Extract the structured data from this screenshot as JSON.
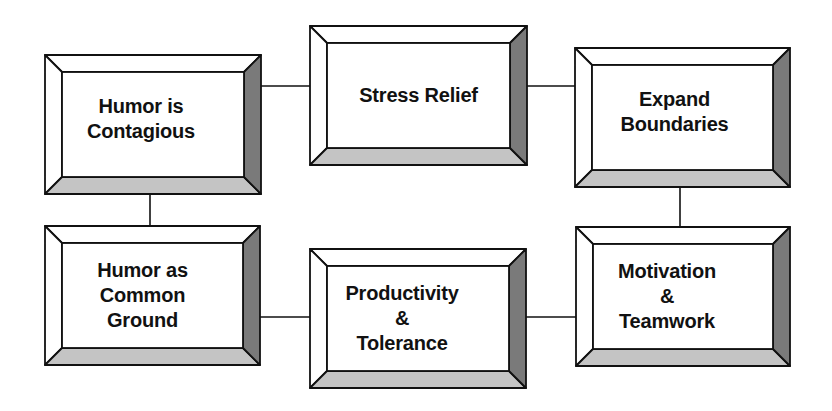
{
  "diagram": {
    "type": "bevel-box-flow",
    "colors": {
      "background": "#ffffff",
      "face": "#ffffff",
      "outline": "#111111",
      "bevel_top": "#ffffff",
      "bevel_left": "#ffffff",
      "bevel_bottom": "#c4c4c4",
      "bevel_right": "#7a7a7a",
      "connector": "#111111"
    },
    "boxes": [
      {
        "id": "humor-is-contagious",
        "lines": [
          "Humor is",
          "Contagious"
        ]
      },
      {
        "id": "stress-relief",
        "lines": [
          "Stress Relief"
        ]
      },
      {
        "id": "expand-boundaries",
        "lines": [
          "Expand",
          "Boundaries"
        ]
      },
      {
        "id": "humor-as-common-ground",
        "lines": [
          "Humor as",
          "Common",
          "Ground"
        ]
      },
      {
        "id": "productivity-tolerance",
        "lines": [
          "Productivity",
          "&",
          "Tolerance"
        ]
      },
      {
        "id": "motivation-teamwork",
        "lines": [
          "Motivation",
          "&",
          "Teamwork"
        ]
      }
    ],
    "connections": [
      {
        "from": "humor-is-contagious",
        "to": "stress-relief"
      },
      {
        "from": "stress-relief",
        "to": "expand-boundaries"
      },
      {
        "from": "humor-is-contagious",
        "to": "humor-as-common-ground"
      },
      {
        "from": "expand-boundaries",
        "to": "motivation-teamwork"
      },
      {
        "from": "humor-as-common-ground",
        "to": "productivity-tolerance"
      },
      {
        "from": "productivity-tolerance",
        "to": "motivation-teamwork"
      }
    ]
  }
}
